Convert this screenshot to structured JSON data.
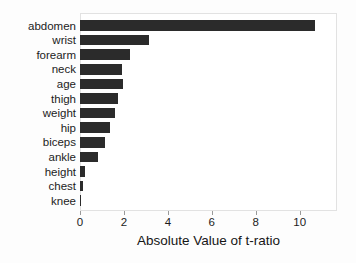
{
  "chart_data": {
    "type": "bar",
    "orientation": "horizontal",
    "title": "",
    "xlabel": "Absolute Value of t-ratio",
    "ylabel": "",
    "categories": [
      "abdomen",
      "wrist",
      "forearm",
      "neck",
      "age",
      "thigh",
      "weight",
      "hip",
      "biceps",
      "ankle",
      "height",
      "chest",
      "knee"
    ],
    "values": [
      10.7,
      3.15,
      2.28,
      1.92,
      1.96,
      1.74,
      1.6,
      1.37,
      1.12,
      0.82,
      0.22,
      0.15,
      0.04
    ],
    "xlim": [
      0,
      11.7
    ],
    "xticks": [
      0,
      2,
      4,
      6,
      8,
      10
    ],
    "xticklabels": [
      "0",
      "2",
      "4",
      "6",
      "8",
      "10"
    ],
    "grid": false,
    "legend": null,
    "bar_color": "#2b2b2b",
    "plot_background": "#ffffff",
    "frame_color": "#e2e2e2"
  }
}
